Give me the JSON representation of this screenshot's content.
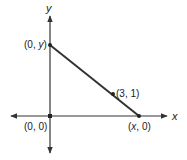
{
  "diagram": {
    "axes": {
      "x_label": "x",
      "y_label": "y"
    },
    "points": [
      {
        "id": "y_intercept",
        "label_pre": "(0, ",
        "label_var": "y",
        "label_post": ")"
      },
      {
        "id": "x_intercept",
        "label_pre": "(",
        "label_var": "x",
        "label_post": ", 0)"
      },
      {
        "id": "given_point",
        "label": "(3, 1)"
      },
      {
        "id": "origin",
        "label": "(0, 0)"
      }
    ],
    "line": {
      "from": "y_intercept",
      "to": "x_intercept",
      "passes_through": "given_point"
    },
    "colors": {
      "stroke": "#333333",
      "background": "#ffffff"
    }
  }
}
